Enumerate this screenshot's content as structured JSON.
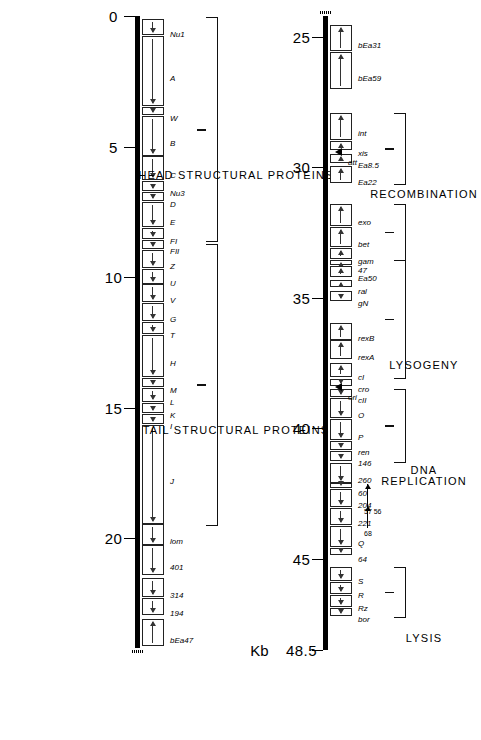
{
  "figure": {
    "unit_label": "Kb",
    "axis_total": "48.5"
  },
  "segments": [
    {
      "id": "right-strip",
      "kb_start": 0,
      "kb_end": 24.2,
      "ticks": [
        {
          "kb": 0,
          "label": "0"
        },
        {
          "kb": 5,
          "label": "5"
        },
        {
          "kb": 10,
          "label": "10"
        },
        {
          "kb": 15,
          "label": "15"
        },
        {
          "kb": 20,
          "label": "20"
        }
      ],
      "genes": [
        {
          "name": "Nu1",
          "start": 0.1,
          "end": 0.72,
          "dir": "right"
        },
        {
          "name": "A",
          "start": 0.75,
          "end": 3.45,
          "dir": "right"
        },
        {
          "name": "W",
          "start": 3.48,
          "end": 3.8,
          "dir": "right"
        },
        {
          "name": "B",
          "start": 3.83,
          "end": 5.35,
          "dir": "right"
        },
        {
          "name": "C",
          "start": 5.38,
          "end": 6.3,
          "dir": "right"
        },
        {
          "name": "Nu3",
          "start": 6.33,
          "end": 6.72,
          "dir": "right"
        },
        {
          "name": "D",
          "start": 6.75,
          "end": 7.1,
          "dir": "right"
        },
        {
          "name": "E",
          "start": 7.13,
          "end": 8.1,
          "dir": "right"
        },
        {
          "name": "FI",
          "start": 8.13,
          "end": 8.55,
          "dir": "right"
        },
        {
          "name": "FII",
          "start": 8.58,
          "end": 8.92,
          "dir": "right"
        },
        {
          "name": "Z",
          "start": 8.95,
          "end": 9.65,
          "dir": "right"
        },
        {
          "name": "U",
          "start": 9.68,
          "end": 10.25,
          "dir": "right"
        },
        {
          "name": "V",
          "start": 10.28,
          "end": 10.95,
          "dir": "right"
        },
        {
          "name": "G",
          "start": 10.98,
          "end": 11.7,
          "dir": "right"
        },
        {
          "name": "T",
          "start": 11.73,
          "end": 12.2,
          "dir": "right"
        },
        {
          "name": "H",
          "start": 12.23,
          "end": 13.85,
          "dir": "right"
        },
        {
          "name": "M",
          "start": 13.88,
          "end": 14.22,
          "dir": "right"
        },
        {
          "name": "L",
          "start": 14.25,
          "end": 14.8,
          "dir": "right"
        },
        {
          "name": "K",
          "start": 14.83,
          "end": 15.22,
          "dir": "right"
        },
        {
          "name": "I",
          "start": 15.25,
          "end": 15.65,
          "dir": "right"
        },
        {
          "name": "J",
          "start": 15.68,
          "end": 19.45,
          "dir": "right"
        },
        {
          "name": "lom",
          "start": 19.48,
          "end": 20.25,
          "dir": "right"
        },
        {
          "name": "401",
          "start": 20.28,
          "end": 21.4,
          "dir": "right"
        },
        {
          "name": "314",
          "start": 21.55,
          "end": 22.25,
          "dir": "right"
        },
        {
          "name": "194",
          "start": 22.28,
          "end": 22.95,
          "dir": "right"
        },
        {
          "name": "bEa47",
          "start": 23.1,
          "end": 24.15,
          "dir": "left"
        }
      ],
      "braces": [
        {
          "label": "HEAD STRUCTURAL PROTEINS",
          "kb_start": 0.05,
          "kb_end": 8.6,
          "lines": [
            "HEAD STRUCTURAL PROTEINS"
          ]
        },
        {
          "label": "TAIL STRUCTURAL PROTEINS",
          "kb_start": 8.75,
          "kb_end": 19.45,
          "lines": [
            "TAIL STRUCTURAL PROTEINS"
          ]
        }
      ],
      "sites": []
    },
    {
      "id": "left-strip",
      "kb_start": 24.2,
      "kb_end": 48.5,
      "ticks": [
        {
          "kb": 25,
          "label": "25"
        },
        {
          "kb": 30,
          "label": "30"
        },
        {
          "kb": 35,
          "label": "35"
        },
        {
          "kb": 40,
          "label": "40"
        },
        {
          "kb": 45,
          "label": "45"
        },
        {
          "kb": 48.5,
          "label": "48.5"
        }
      ],
      "genes": [
        {
          "name": "bEa31",
          "start": 24.55,
          "end": 25.55,
          "dir": "left"
        },
        {
          "name": "bEa59",
          "start": 25.58,
          "end": 27.0,
          "dir": "left"
        },
        {
          "name": "int",
          "start": 27.9,
          "end": 28.95,
          "dir": "left"
        },
        {
          "name": "xis",
          "start": 28.98,
          "end": 29.35,
          "dir": "left"
        },
        {
          "name": "Ea8.5",
          "start": 29.48,
          "end": 29.82,
          "dir": "left"
        },
        {
          "name": "Ea22",
          "start": 29.95,
          "end": 30.6,
          "dir": "left"
        },
        {
          "name": "exo",
          "start": 31.4,
          "end": 32.25,
          "dir": "left"
        },
        {
          "name": "bet",
          "start": 32.28,
          "end": 33.05,
          "dir": "left"
        },
        {
          "name": "gam",
          "start": 33.08,
          "end": 33.52,
          "dir": "left"
        },
        {
          "name": "47",
          "start": 33.55,
          "end": 33.74,
          "dir": "left"
        },
        {
          "name": "Ea50",
          "start": 33.77,
          "end": 34.2,
          "dir": "left"
        },
        {
          "name": "ral",
          "start": 34.3,
          "end": 34.6,
          "dir": "left"
        },
        {
          "name": "gN",
          "start": 34.72,
          "end": 35.12,
          "dir": "right"
        },
        {
          "name": "rexB",
          "start": 35.95,
          "end": 36.6,
          "dir": "left"
        },
        {
          "name": "rexA",
          "start": 36.63,
          "end": 37.35,
          "dir": "left"
        },
        {
          "name": "cI",
          "start": 37.48,
          "end": 38.05,
          "dir": "left"
        },
        {
          "name": "cro",
          "start": 38.1,
          "end": 38.38,
          "dir": "right"
        },
        {
          "name": "cII",
          "start": 38.48,
          "end": 38.8,
          "dir": "right"
        },
        {
          "name": "O",
          "start": 38.83,
          "end": 39.62,
          "dir": "right"
        },
        {
          "name": "P",
          "start": 39.65,
          "end": 40.45,
          "dir": "right"
        },
        {
          "name": "ren",
          "start": 40.48,
          "end": 40.82,
          "dir": "right"
        },
        {
          "name": "146",
          "start": 40.85,
          "end": 41.25,
          "dir": "right"
        },
        {
          "name": "260",
          "start": 41.32,
          "end": 42.08,
          "dir": "right"
        },
        {
          "name": "60",
          "start": 42.11,
          "end": 42.3,
          "dir": "right"
        },
        {
          "name": "204",
          "start": 42.33,
          "end": 43.0,
          "dir": "right"
        },
        {
          "name": "221",
          "start": 43.05,
          "end": 43.7,
          "dir": "right"
        },
        {
          "name": "Q",
          "start": 43.73,
          "end": 44.55,
          "dir": "right"
        },
        {
          "name": "64",
          "start": 44.6,
          "end": 44.85,
          "dir": "right"
        },
        {
          "name": "S",
          "start": 45.3,
          "end": 45.85,
          "dir": "right"
        },
        {
          "name": "R",
          "start": 45.88,
          "end": 46.35,
          "dir": "right"
        },
        {
          "name": "Rz",
          "start": 46.38,
          "end": 46.85,
          "dir": "right"
        },
        {
          "name": "bor",
          "start": 46.88,
          "end": 47.2,
          "dir": "right"
        }
      ],
      "callouts": [
        {
          "label": "57 56",
          "kb": 42.12
        },
        {
          "label": "68",
          "kb": 42.98
        }
      ],
      "braces": [
        {
          "label": "RECOMBINATION-A",
          "kb_start": 27.9,
          "kb_end": 30.6,
          "lines": [
            "RECOMBINATION"
          ]
        },
        {
          "label": "RECOMBINATION-B",
          "kb_start": 31.4,
          "kb_end": 33.52,
          "lines": [
            ""
          ]
        },
        {
          "label": "LYSOGENY",
          "kb_start": 33.55,
          "kb_end": 38.05,
          "lines": [
            "LYSOGENY"
          ]
        },
        {
          "label": "DNA REPLICATION",
          "kb_start": 38.48,
          "kb_end": 41.25,
          "lines": [
            "DNA",
            "REPLICATION"
          ]
        },
        {
          "label": "LYSIS",
          "kb_start": 45.3,
          "kb_end": 47.2,
          "lines": [
            "LYSIS"
          ]
        }
      ],
      "sites": [
        {
          "name": "att",
          "kb": 29.42
        },
        {
          "name": "ori",
          "kb": 38.42
        }
      ]
    }
  ],
  "group_labels": {
    "head": "HEAD STRUCTURAL PROTEINS",
    "tail": "TAIL STRUCTURAL PROTEINS",
    "recombination": "RECOMBINATION",
    "lysogeny": "LYSOGENY",
    "dna_replication_l1": "DNA",
    "dna_replication_l2": "REPLICATION",
    "lysis": "LYSIS"
  },
  "colors": {
    "line": "#000000",
    "box_stroke": "#222222",
    "background": "#ffffff"
  }
}
